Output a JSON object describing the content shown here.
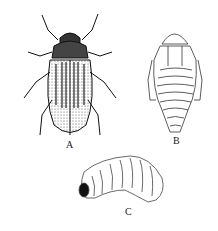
{
  "figure": {
    "labels": {
      "a": "A",
      "b": "B",
      "c": "C"
    },
    "panels": [
      {
        "id": "A",
        "subject": "adult-beetle"
      },
      {
        "id": "B",
        "subject": "pupa"
      },
      {
        "id": "C",
        "subject": "larva"
      }
    ]
  }
}
